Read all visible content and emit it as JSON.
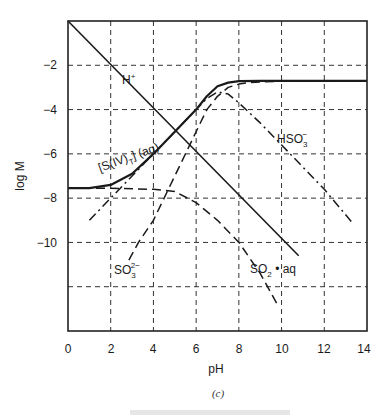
{
  "chart_data": {
    "type": "line",
    "title": "",
    "xlabel": "pH",
    "ylabel": "log M",
    "xlim": [
      0,
      14
    ],
    "ylim": [
      -14,
      0
    ],
    "grid": true,
    "x_ticks": [
      0,
      2,
      4,
      6,
      8,
      10,
      12,
      14
    ],
    "x_tick_labels": [
      "0",
      "2",
      "4",
      "6",
      "8",
      "10",
      "12",
      "14"
    ],
    "y_ticks": [
      -2,
      -4,
      -6,
      -8,
      -10,
      -12
    ],
    "y_tick_labels": [
      "−2",
      "−4",
      "−6",
      "−8",
      "−10",
      ""
    ],
    "series": [
      {
        "name": "H+",
        "style": "solid",
        "x": [
          0,
          10.8
        ],
        "y": [
          0,
          -10.6
        ]
      },
      {
        "name": "[S(IV)T] (aq)",
        "style": "solid-thick",
        "x": [
          0,
          1,
          2,
          3,
          4,
          5,
          6,
          6.5,
          7,
          7.5,
          8,
          9,
          10,
          12,
          14
        ],
        "y": [
          -7.55,
          -7.55,
          -7.4,
          -6.9,
          -6.0,
          -5.0,
          -4.0,
          -3.4,
          -2.95,
          -2.78,
          -2.72,
          -2.7,
          -2.7,
          -2.7,
          -2.7
        ]
      },
      {
        "name": "SO2 · aq",
        "style": "dashed",
        "x": [
          0,
          2,
          4,
          5,
          6,
          7,
          8,
          9,
          9.8
        ],
        "y": [
          -7.55,
          -7.55,
          -7.6,
          -7.7,
          -8.2,
          -9.0,
          -10.0,
          -11.4,
          -12.8
        ]
      },
      {
        "name": "HSO3-",
        "style": "dash-dot",
        "x": [
          1,
          2,
          3,
          4,
          5,
          6,
          6.5,
          7,
          7.5,
          8,
          9,
          10,
          11,
          12,
          13.3
        ],
        "y": [
          -9.0,
          -8.0,
          -7.0,
          -6.0,
          -5.0,
          -4.0,
          -3.5,
          -3.2,
          -3.3,
          -3.7,
          -4.6,
          -5.6,
          -6.6,
          -7.6,
          -9.1
        ]
      },
      {
        "name": "SO3 2-",
        "style": "dashed",
        "x": [
          2.85,
          3.3,
          4,
          5,
          6,
          6.5,
          7,
          7.5,
          8,
          8.5,
          9,
          10,
          12,
          14
        ],
        "y": [
          -10.8,
          -10.0,
          -9.0,
          -7.0,
          -5.0,
          -4.0,
          -3.4,
          -3.0,
          -2.85,
          -2.78,
          -2.75,
          -2.72,
          -2.7,
          -2.7
        ]
      }
    ],
    "annotations": [
      {
        "text": "H+",
        "x": 2.6,
        "y": -2.7
      },
      {
        "text": "[S(IV)T] (aq)",
        "x": 1.5,
        "y": -6.2
      },
      {
        "text": "HSO3-",
        "x": 9.4,
        "y": -5.3
      },
      {
        "text": "SO3 2-",
        "x": 2.7,
        "y": -11.3
      },
      {
        "text": "SO2 · aq",
        "x": 8.6,
        "y": -11.4
      }
    ],
    "caption": "(c)"
  },
  "labels": {
    "xlabel": "pH",
    "ylabel": "log M",
    "caption": "(c)",
    "h_plus": "H",
    "h_plus_sup": "+",
    "siv_a": "[S(IV)",
    "siv_sub": "T",
    "siv_b": "] (aq)",
    "hso3": "HSO",
    "hso3_sub": "3",
    "hso3_sup": "−",
    "so3": "SO",
    "so3_sub": "3",
    "so3_sup": "2−",
    "so2": "SO",
    "so2_sub": "2",
    "so2_b": " • aq"
  },
  "ticks": {
    "x": [
      "0",
      "2",
      "4",
      "6",
      "8",
      "10",
      "12",
      "14"
    ],
    "y": [
      "−2",
      "−4",
      "−6",
      "−8",
      "−10"
    ]
  }
}
